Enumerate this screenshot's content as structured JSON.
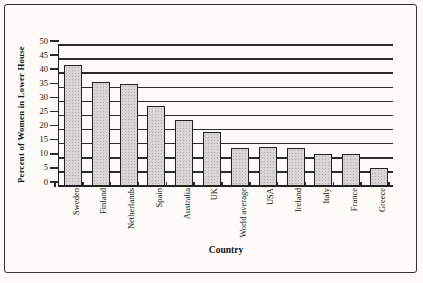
{
  "figure": {
    "kind": "scanned bar chart",
    "paper_color": "#fbfaf6"
  },
  "chart_data": {
    "type": "bar",
    "title": "",
    "categories": [
      "Sweden",
      "Finland",
      "Netherlands",
      "Spain",
      "Australia",
      "UK",
      "World average",
      "USA",
      "Ireland",
      "Italy",
      "France",
      "Greece"
    ],
    "values": [
      43,
      37,
      36,
      28.5,
      23.5,
      19,
      13.5,
      14,
      13.5,
      11.5,
      11.5,
      6.5
    ],
    "xlabel": "Country",
    "ylabel": "Percent of Women in Lower House",
    "ylim": [
      0,
      50
    ],
    "yticks": [
      0,
      5,
      10,
      15,
      20,
      25,
      30,
      35,
      40,
      45,
      50
    ],
    "grid": true,
    "legend": null,
    "bar_fill": "#d8d7d3",
    "bar_border": "#222222",
    "line_color": "#2b2b2b"
  }
}
